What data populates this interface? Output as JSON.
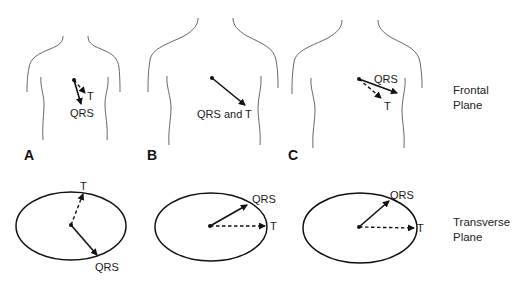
{
  "figure": {
    "type": "ECG vector diagram",
    "panels": [
      {
        "id": "A",
        "label": "A",
        "frontal": {
          "qrs_label": "QRS",
          "t_label": "T"
        },
        "transverse": {
          "qrs_label": "QRS",
          "t_label": "T"
        }
      },
      {
        "id": "B",
        "label": "B",
        "frontal": {
          "combined_label": "QRS and T"
        },
        "transverse": {
          "qrs_label": "QRS",
          "t_label": "T"
        }
      },
      {
        "id": "C",
        "label": "C",
        "frontal": {
          "qrs_label": "QRS",
          "t_label": "T"
        },
        "transverse": {
          "qrs_label": "QRS",
          "t_label": "T"
        }
      }
    ],
    "row_labels": {
      "frontal": {
        "line1": "Frontal",
        "line2": "Plane"
      },
      "transverse": {
        "line1": "Transverse",
        "line2": "Plane"
      }
    },
    "legend": {
      "solid_arrow": "QRS",
      "dashed_arrow": "T"
    }
  }
}
